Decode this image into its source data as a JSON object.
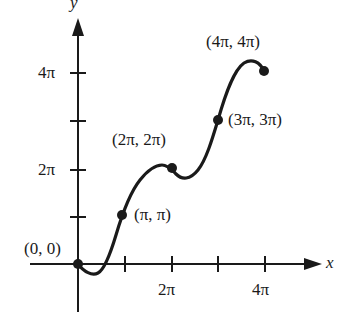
{
  "diagram": {
    "type": "parametric-curve-plot",
    "axes": {
      "x_label": "x",
      "y_label": "y",
      "x_ticks": [
        "",
        "2π",
        "",
        "4π"
      ],
      "y_ticks": [
        "",
        "2π",
        "",
        "4π"
      ]
    },
    "points": [
      {
        "label": "(0, 0)",
        "x": "0",
        "y": "0"
      },
      {
        "label": "(π, π)",
        "x": "π",
        "y": "π"
      },
      {
        "label": "(2π, 2π)",
        "x": "2π",
        "y": "2π"
      },
      {
        "label": "(3π, 3π)",
        "x": "3π",
        "y": "3π"
      },
      {
        "label": "(4π, 4π)",
        "x": "4π",
        "y": "4π"
      }
    ],
    "colors": {
      "ink": "#1a1a1a",
      "background": "#ffffff"
    }
  }
}
